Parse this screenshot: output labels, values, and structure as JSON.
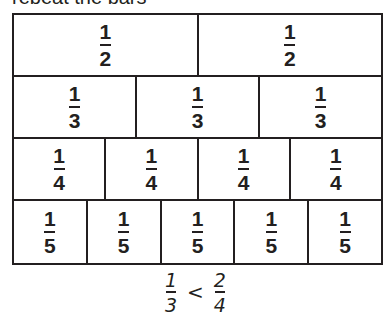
{
  "header": {
    "text": "repeat the bars"
  },
  "fraction_strips": {
    "rows": [
      {
        "denominator": "2",
        "cells": [
          {
            "numerator": "1",
            "denominator": "2"
          },
          {
            "numerator": "1",
            "denominator": "2"
          }
        ]
      },
      {
        "denominator": "3",
        "cells": [
          {
            "numerator": "1",
            "denominator": "3"
          },
          {
            "numerator": "1",
            "denominator": "3"
          },
          {
            "numerator": "1",
            "denominator": "3"
          }
        ]
      },
      {
        "denominator": "4",
        "cells": [
          {
            "numerator": "1",
            "denominator": "4"
          },
          {
            "numerator": "1",
            "denominator": "4"
          },
          {
            "numerator": "1",
            "denominator": "4"
          },
          {
            "numerator": "1",
            "denominator": "4"
          }
        ]
      },
      {
        "denominator": "5",
        "cells": [
          {
            "numerator": "1",
            "denominator": "5"
          },
          {
            "numerator": "1",
            "denominator": "5"
          },
          {
            "numerator": "1",
            "denominator": "5"
          },
          {
            "numerator": "1",
            "denominator": "5"
          },
          {
            "numerator": "1",
            "denominator": "5"
          }
        ]
      }
    ]
  },
  "comparison": {
    "left": {
      "numerator": "1",
      "denominator": "3"
    },
    "operator": "<",
    "right": {
      "numerator": "2",
      "denominator": "4"
    }
  },
  "colors": {
    "ink": "#231f20",
    "background": "#ffffff"
  }
}
